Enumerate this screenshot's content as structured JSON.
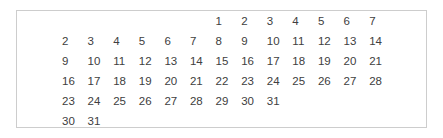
{
  "table": {
    "rows": [
      [
        "",
        "",
        "",
        "",
        "",
        "",
        "1",
        "2",
        "3",
        "4",
        "5",
        "6",
        "7"
      ],
      [
        "2",
        "3",
        "4",
        "5",
        "6",
        "7",
        "8",
        "9",
        "10",
        "11",
        "12",
        "13",
        "14"
      ],
      [
        "9",
        "10",
        "11",
        "12",
        "13",
        "14",
        "15",
        "16",
        "17",
        "18",
        "19",
        "20",
        "21"
      ],
      [
        "16",
        "17",
        "18",
        "19",
        "20",
        "21",
        "22",
        "23",
        "24",
        "25",
        "26",
        "27",
        "28"
      ],
      [
        "23",
        "24",
        "25",
        "26",
        "27",
        "28",
        "29",
        "30",
        "31",
        "",
        "",
        "",
        ""
      ],
      [
        "30",
        "31",
        "",
        "",
        "",
        "",
        "",
        "",
        "",
        "",
        "",
        "",
        ""
      ]
    ]
  },
  "colors": {
    "text": "#404040",
    "border": "#cdcdcd",
    "background": "#ffffff"
  }
}
